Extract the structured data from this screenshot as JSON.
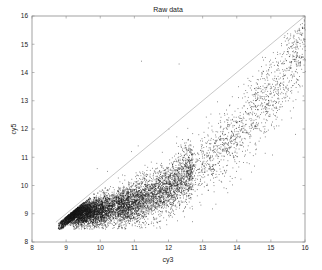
{
  "chart_data": {
    "type": "scatter",
    "title": "Raw data",
    "xlabel": "cy3",
    "ylabel": "cy5",
    "xlim": [
      8,
      16
    ],
    "ylim": [
      8,
      16
    ],
    "xticks": [
      8,
      9,
      10,
      11,
      12,
      13,
      14,
      15,
      16
    ],
    "yticks": [
      8,
      9,
      10,
      11,
      12,
      13,
      14,
      15,
      16
    ],
    "grid": false,
    "legend": null,
    "reference_line": {
      "label": "y = x",
      "from": [
        8.7,
        8.7
      ],
      "to": [
        16,
        16
      ],
      "color": "#c8c8c8"
    },
    "marker_color": "#1a1a1a",
    "series": [
      {
        "name": "spots",
        "approx_points": 10000,
        "trend": [
          {
            "x": 9.0,
            "y": 9.0
          },
          {
            "x": 10.0,
            "y": 9.1
          },
          {
            "x": 11.0,
            "y": 9.4
          },
          {
            "x": 12.0,
            "y": 9.9
          },
          {
            "x": 13.0,
            "y": 10.8
          },
          {
            "x": 14.0,
            "y": 11.9
          },
          {
            "x": 15.0,
            "y": 13.2
          },
          {
            "x": 16.0,
            "y": 15.0
          }
        ],
        "outliers": [
          {
            "x": 11.2,
            "y": 14.4
          },
          {
            "x": 12.3,
            "y": 14.3
          },
          {
            "x": 12.0,
            "y": 12.0
          },
          {
            "x": 11.1,
            "y": 11.4
          },
          {
            "x": 9.9,
            "y": 10.6
          },
          {
            "x": 10.2,
            "y": 10.5
          },
          {
            "x": 10.9,
            "y": 11.2
          }
        ]
      }
    ]
  }
}
